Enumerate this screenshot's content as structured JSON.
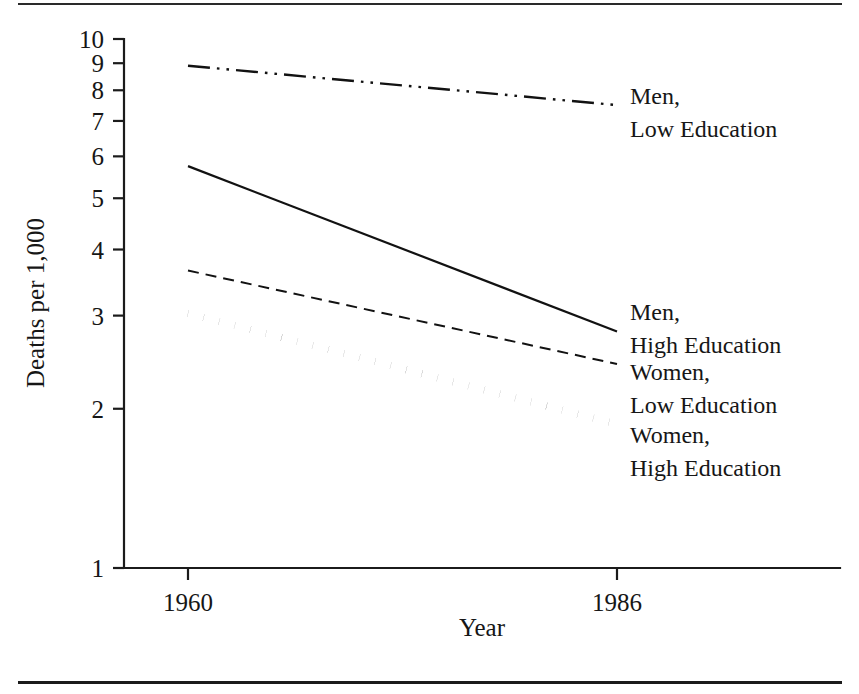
{
  "figure": {
    "has_top_rule": true,
    "has_bottom_rule": true,
    "ink_color": "#161616",
    "background_color": "#ffffff"
  },
  "chart_data": {
    "type": "line",
    "title": "",
    "subtitle": "",
    "xlabel": "Year",
    "ylabel": "Deaths per 1,000",
    "x": [
      1960,
      1986
    ],
    "xtick_labels": [
      "1960",
      "1986"
    ],
    "xlim": [
      1960,
      1986
    ],
    "yscale": "log",
    "ylim": [
      1,
      10
    ],
    "ytick_labels": [
      "1",
      "2",
      "3",
      "4",
      "5",
      "6",
      "7",
      "8",
      "9",
      "10"
    ],
    "ytick_values": [
      1,
      2,
      3,
      4,
      5,
      6,
      7,
      8,
      9,
      10
    ],
    "grid": false,
    "legend_position": "right-inline-annotations",
    "series": [
      {
        "name": "Men, Low Education",
        "label_line1": "Men,",
        "label_line2": "Low Education",
        "values": [
          8.9,
          7.5
        ],
        "linestyle": "dash-dot-dot",
        "linewidth": 2.4,
        "color": "#121212"
      },
      {
        "name": "Men, High Education",
        "label_line1": "Men,",
        "label_line2": "High Education",
        "values": [
          5.75,
          2.8
        ],
        "linestyle": "solid",
        "linewidth": 2.2,
        "color": "#121212"
      },
      {
        "name": "Women, Low Education",
        "label_line1": "Women,",
        "label_line2": "Low Education",
        "values": [
          3.65,
          2.43
        ],
        "linestyle": "dashed",
        "linewidth": 2.0,
        "color": "#121212"
      },
      {
        "name": "Women, High Education",
        "label_line1": "Women,",
        "label_line2": "High Education",
        "values": [
          3.03,
          1.87
        ],
        "linestyle": "thick-dotted",
        "linewidth": 7.5,
        "color": "#0d0d0d"
      }
    ]
  }
}
